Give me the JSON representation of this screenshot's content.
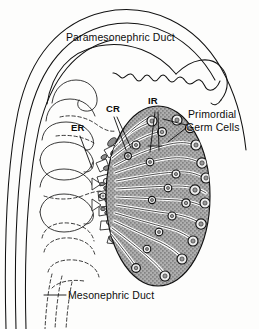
{
  "figure": {
    "title_visible": false,
    "background_color": "#fdfdfc",
    "ink_color": "#111111",
    "gonad_fill": "#a8a8a8"
  },
  "labels": {
    "paramesonephric_duct": "Paramesonephric Duct",
    "mesonephric_duct": "Mesonephric Duct",
    "primordial_germ_cells_line1": "Primordial",
    "primordial_germ_cells_line2": "Germ Cells",
    "cortical_rete": "CR",
    "intermediate_rete": "IR",
    "extra_rete": "ER"
  },
  "leaders": {
    "cr_count": 2,
    "ir_count": 2,
    "er_count": 1,
    "pgc_count": 2,
    "mesonephric_count": 1
  },
  "gonad": {
    "shape": "oval",
    "center_x": 158,
    "center_y": 196,
    "radius_x": 52,
    "radius_y": 90,
    "cord_count": 16,
    "germ_cell_count": 24
  }
}
